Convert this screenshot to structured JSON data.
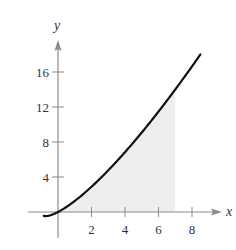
{
  "chart_data": {
    "type": "line",
    "title": "",
    "xlabel": "x",
    "ylabel": "y",
    "xlim": [
      -1.2,
      10
    ],
    "ylim": [
      -2,
      20
    ],
    "x_ticks": [
      2,
      4,
      6,
      8
    ],
    "y_ticks": [
      4,
      8,
      12,
      16
    ],
    "x_tick_labels": [
      "2",
      "4",
      "6",
      "8"
    ],
    "y_tick_labels": [
      "4",
      "8",
      "12",
      "16"
    ],
    "grid": false,
    "legend": null,
    "series": [
      {
        "name": "curve",
        "color": "#111111",
        "x": [
          -0.8,
          -0.6,
          -0.4,
          -0.2,
          0,
          1,
          2,
          3,
          4,
          5,
          6,
          7,
          8,
          8.5
        ],
        "values": [
          -0.47,
          -0.44,
          -0.34,
          -0.19,
          0,
          1.26,
          2.88,
          4.76,
          6.84,
          9.09,
          11.48,
          14.0,
          16.64,
          18.0
        ]
      }
    ],
    "shaded_region": {
      "from_x": 0,
      "to_x": 7,
      "color": "#eeeeee",
      "description": "area under curve"
    }
  },
  "axes": {
    "x_label": "x",
    "y_label": "y"
  }
}
